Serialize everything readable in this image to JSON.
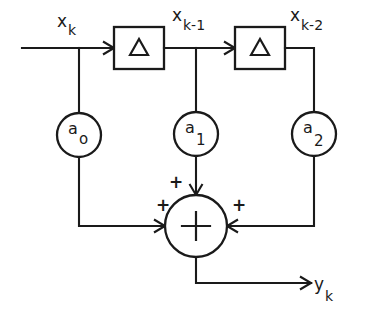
{
  "diagram": {
    "type": "block-diagram",
    "line_color": "#1a1a1a",
    "background_color": "#ffffff",
    "labels": {
      "input": {
        "base": "x",
        "sub": "k"
      },
      "delay1_out": {
        "base": "x",
        "sub": "k-1"
      },
      "delay2_out": {
        "base": "x",
        "sub": "k-2"
      },
      "output": {
        "base": "y",
        "sub": "k"
      }
    },
    "delay_blocks": [
      {
        "id": "delay-1",
        "symbol": "Δ"
      },
      {
        "id": "delay-2",
        "symbol": "Δ"
      }
    ],
    "coefficients": [
      {
        "id": "coef-a0",
        "base": "a",
        "sub": "o"
      },
      {
        "id": "coef-a1",
        "base": "a",
        "sub": "1"
      },
      {
        "id": "coef-a2",
        "base": "a",
        "sub": "2"
      }
    ],
    "summer": {
      "symbol": "+",
      "input_signs": [
        "+",
        "+",
        "+"
      ]
    }
  }
}
